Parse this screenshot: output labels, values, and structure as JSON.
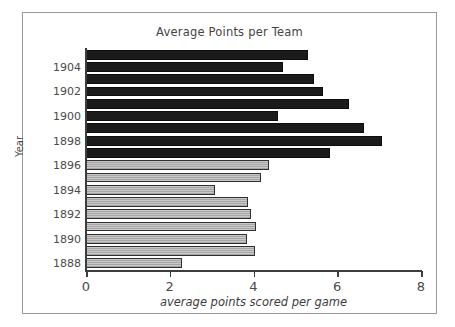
{
  "chart_data": {
    "type": "bar",
    "orientation": "horizontal",
    "title": "Average Points per Team",
    "xlabel": "average points scored per game",
    "ylabel": "Year",
    "xlim": [
      0,
      8
    ],
    "xticks": [
      0,
      2,
      4,
      6,
      8
    ],
    "xtick_labels": [
      "0",
      "2",
      "4",
      "6",
      "8"
    ],
    "ytick_labels": [
      "1904",
      "1902",
      "1900",
      "1898",
      "1896",
      "1894",
      "1892",
      "1890",
      "1888"
    ],
    "grid": false,
    "legend": null,
    "categories": [
      1905,
      1904,
      1903,
      1902,
      1901,
      1900,
      1899,
      1898,
      1897,
      1896,
      1895,
      1894,
      1893,
      1892,
      1891,
      1890,
      1889,
      1888
    ],
    "values": [
      5.3,
      4.7,
      5.44,
      5.67,
      6.27,
      4.59,
      6.63,
      7.06,
      5.83,
      4.38,
      4.17,
      3.08,
      3.86,
      3.94,
      4.05,
      3.85,
      4.03,
      2.3
    ],
    "bars": [
      {
        "year": "1905",
        "value": 5.3,
        "style": "dark"
      },
      {
        "year": "1904",
        "value": 4.7,
        "style": "dark"
      },
      {
        "year": "1903",
        "value": 5.44,
        "style": "dark"
      },
      {
        "year": "1902",
        "value": 5.67,
        "style": "dark"
      },
      {
        "year": "1901",
        "value": 6.27,
        "style": "dark"
      },
      {
        "year": "1900",
        "value": 4.59,
        "style": "dark"
      },
      {
        "year": "1899",
        "value": 6.63,
        "style": "dark"
      },
      {
        "year": "1898",
        "value": 7.06,
        "style": "dark"
      },
      {
        "year": "1897",
        "value": 5.83,
        "style": "dark"
      },
      {
        "year": "1896",
        "value": 4.38,
        "style": "light"
      },
      {
        "year": "1895",
        "value": 4.17,
        "style": "light"
      },
      {
        "year": "1894",
        "value": 3.08,
        "style": "light"
      },
      {
        "year": "1893",
        "value": 3.86,
        "style": "light"
      },
      {
        "year": "1892",
        "value": 3.94,
        "style": "light"
      },
      {
        "year": "1891",
        "value": 4.05,
        "style": "light"
      },
      {
        "year": "1890",
        "value": 3.85,
        "style": "light"
      },
      {
        "year": "1889",
        "value": 4.03,
        "style": "light"
      },
      {
        "year": "1888",
        "value": 2.3,
        "style": "light"
      }
    ],
    "colors": {
      "dark_bar": "#1b1b1b",
      "light_bar": "#a6a6a6",
      "bar_edge": "#2f2f2f",
      "axis": "#3d3d3d",
      "text": "#4a4a4a",
      "frame": "#9a9a9a",
      "background": "#ffffff"
    }
  }
}
